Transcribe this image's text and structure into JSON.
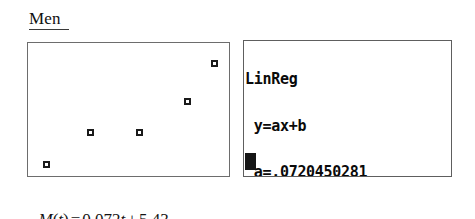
{
  "heading": {
    "label": "Men"
  },
  "scatter": {
    "name": "men-scatter-plot",
    "marker_color": "#1a1a1a",
    "border_color": "#6d6d6d",
    "points": [
      {
        "cx": 45,
        "cy": 163
      },
      {
        "cx": 89,
        "cy": 131
      },
      {
        "cx": 138,
        "cy": 131
      },
      {
        "cx": 186,
        "cy": 100
      },
      {
        "cx": 213,
        "cy": 62
      }
    ]
  },
  "calculator": {
    "lines": [
      "LinReg",
      " y=ax+b",
      " a=.0720450281",
      " b=5.428142589"
    ],
    "cursor": "█",
    "text_color": "#0a0a0a",
    "border_color": "#5e5e5e"
  },
  "caption": {
    "fn_name": "M",
    "open_paren": "(",
    "variable": "t",
    "close_paren": ")",
    "equals": "=",
    "slope": "0.072",
    "slope_variable": "t",
    "plus": "+",
    "intercept": "5.43",
    "full_text": "M(t) = 0.072t + 5.43"
  },
  "chart_data": {
    "type": "scatter",
    "title": "Men",
    "xlabel": "",
    "ylabel": "",
    "grid": false,
    "legend": "none",
    "annotations": [
      "M(t) = 0.072t + 5.43",
      "LinReg y=ax+b  a=.0720450281  b=5.428142589"
    ],
    "regression": {
      "model": "y=ax+b",
      "a": 0.0720450281,
      "b": 5.428142589,
      "rounded_equation": "M(t) = 0.072t + 5.43"
    },
    "pixel_points": [
      {
        "x": 45,
        "y": 163
      },
      {
        "x": 89,
        "y": 131
      },
      {
        "x": 138,
        "y": 131
      },
      {
        "x": 186,
        "y": 100
      },
      {
        "x": 213,
        "y": 62
      }
    ]
  }
}
